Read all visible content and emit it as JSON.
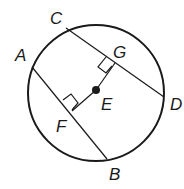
{
  "diagram": {
    "type": "circle-geometry",
    "labels": {
      "A": "A",
      "B": "B",
      "C": "C",
      "D": "D",
      "E": "E",
      "F": "F",
      "G": "G"
    },
    "center": "E",
    "chords": [
      "AB",
      "CD"
    ],
    "perpendiculars": [
      {
        "segment": "EF",
        "to_chord": "AB",
        "right_angle_at": "F"
      },
      {
        "segment": "EG",
        "to_chord": "CD",
        "right_angle_at": "G"
      }
    ],
    "colors": {
      "stroke": "#1a1a1a",
      "background": "#ffffff"
    }
  }
}
